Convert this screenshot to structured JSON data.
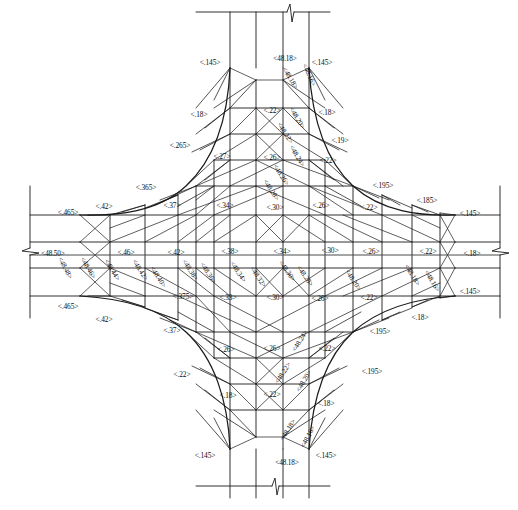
{
  "drawing": {
    "title": "Intersection Grading / Contour Plan",
    "units_note": "",
    "caption": "",
    "line_color": "#1a1a1a",
    "text_color": "#0d0d0d",
    "background": "#ffffff"
  },
  "elevations": {
    "center_west": "<48.50>",
    "list": [
      "<48.48>",
      "<48.46>",
      "<48.44>",
      "<48.42>",
      "<48.40>",
      "<48.38>",
      "<48.36>",
      "<48.34>",
      "<48.32>",
      "<48.30>",
      "<48.28>",
      "<48.26>",
      "<48.24>",
      "<48.22>",
      "<48.20>",
      "<48.18>",
      "<48.16>"
    ]
  },
  "edge_labels": {
    "north_center": "<48.18>",
    "south_center": "<48.18>",
    "west_center": "<48.50>",
    "east_center": "<.18>"
  },
  "slope_labels": {
    "values": [
      "<.145>",
      "<.18>",
      "<.19>",
      "<.195>",
      "<.185>",
      "<.22>",
      "<.26>",
      "<.265>",
      "<.27>",
      "<.30>",
      "<.33>",
      "<.34>",
      "<.365>",
      "<.37>",
      "<.375>",
      "<.38>",
      "<.42>",
      "<.46>",
      "<.465>"
    ]
  },
  "annotations": [
    {
      "id": "a01",
      "text": "<.145>",
      "x": 210,
      "y": 63,
      "rot": 0,
      "kind": "slope"
    },
    {
      "id": "a02",
      "text": "<48.18>",
      "x": 285,
      "y": 59,
      "rot": 0,
      "kind": "elev"
    },
    {
      "id": "a03",
      "text": "<.145>",
      "x": 322,
      "y": 63,
      "rot": 0,
      "kind": "slope"
    },
    {
      "id": "a04",
      "text": "<48.18>",
      "x": 290,
      "y": 78,
      "rot": 58,
      "kind": "elev"
    },
    {
      "id": "a05",
      "text": "<48.16>",
      "x": 309,
      "y": 75,
      "rot": 66,
      "kind": "elev"
    },
    {
      "id": "a06",
      "text": "<.18>",
      "x": 199,
      "y": 115,
      "rot": 0,
      "kind": "slope"
    },
    {
      "id": "a07",
      "text": "<.22>",
      "x": 272,
      "y": 111,
      "rot": 0,
      "kind": "slope"
    },
    {
      "id": "a08",
      "text": "<48.20>",
      "x": 297,
      "y": 118,
      "rot": 60,
      "kind": "elev"
    },
    {
      "id": "a09",
      "text": "<.18>",
      "x": 327,
      "y": 113,
      "rot": 0,
      "kind": "slope"
    },
    {
      "id": "a10",
      "text": "<48.22>",
      "x": 285,
      "y": 133,
      "rot": 57,
      "kind": "elev"
    },
    {
      "id": "a11",
      "text": "<.19>",
      "x": 340,
      "y": 141,
      "rot": 0,
      "kind": "slope"
    },
    {
      "id": "a12",
      "text": "<.265>",
      "x": 180,
      "y": 146,
      "rot": 0,
      "kind": "slope"
    },
    {
      "id": "a13",
      "text": "<.27>",
      "x": 222,
      "y": 157,
      "rot": 0,
      "kind": "slope"
    },
    {
      "id": "a14",
      "text": "<.26>",
      "x": 272,
      "y": 158,
      "rot": 0,
      "kind": "slope"
    },
    {
      "id": "a15",
      "text": "<48.24>",
      "x": 297,
      "y": 156,
      "rot": 60,
      "kind": "elev"
    },
    {
      "id": "a16",
      "text": "<.22>",
      "x": 328,
      "y": 161,
      "rot": 0,
      "kind": "slope"
    },
    {
      "id": "a17",
      "text": "<48.26>",
      "x": 281,
      "y": 175,
      "rot": 57,
      "kind": "elev"
    },
    {
      "id": "a18",
      "text": "<.365>",
      "x": 146,
      "y": 188,
      "rot": 0,
      "kind": "slope"
    },
    {
      "id": "a19",
      "text": "<48.28>",
      "x": 271,
      "y": 190,
      "rot": 57,
      "kind": "elev"
    },
    {
      "id": "a20",
      "text": "<.195>",
      "x": 383,
      "y": 186,
      "rot": 0,
      "kind": "slope"
    },
    {
      "id": "a21",
      "text": "<.185>",
      "x": 427,
      "y": 201,
      "rot": 0,
      "kind": "slope"
    },
    {
      "id": "a22",
      "text": "<.42>",
      "x": 104,
      "y": 207,
      "rot": 0,
      "kind": "slope"
    },
    {
      "id": "a23",
      "text": "<.37>",
      "x": 172,
      "y": 206,
      "rot": 0,
      "kind": "slope"
    },
    {
      "id": "a24",
      "text": "<.34>",
      "x": 225,
      "y": 206,
      "rot": 0,
      "kind": "slope"
    },
    {
      "id": "a25",
      "text": "<.30>",
      "x": 275,
      "y": 208,
      "rot": 0,
      "kind": "slope"
    },
    {
      "id": "a26",
      "text": "<.26>",
      "x": 321,
      "y": 206,
      "rot": 0,
      "kind": "slope"
    },
    {
      "id": "a27",
      "text": "<.22>",
      "x": 369,
      "y": 208,
      "rot": 0,
      "kind": "slope"
    },
    {
      "id": "a28",
      "text": "<.465>",
      "x": 68,
      "y": 213,
      "rot": 0,
      "kind": "slope"
    },
    {
      "id": "a29",
      "text": "<.145>",
      "x": 470,
      "y": 214,
      "rot": 0,
      "kind": "slope"
    },
    {
      "id": "a30",
      "text": "<48.50>",
      "x": 53,
      "y": 254,
      "rot": 0,
      "kind": "elev"
    },
    {
      "id": "a31",
      "text": "<48.48>",
      "x": 65,
      "y": 268,
      "rot": 62,
      "kind": "elev"
    },
    {
      "id": "a32",
      "text": "<48.46>",
      "x": 88,
      "y": 268,
      "rot": 60,
      "kind": "elev"
    },
    {
      "id": "a33",
      "text": "<.46>",
      "x": 126,
      "y": 253,
      "rot": 0,
      "kind": "slope"
    },
    {
      "id": "a34",
      "text": "<48.44>",
      "x": 112,
      "y": 270,
      "rot": 58,
      "kind": "elev"
    },
    {
      "id": "a35",
      "text": "<.42>",
      "x": 176,
      "y": 253,
      "rot": 0,
      "kind": "slope"
    },
    {
      "id": "a36",
      "text": "<48.42>",
      "x": 140,
      "y": 270,
      "rot": 57,
      "kind": "elev"
    },
    {
      "id": "a37",
      "text": "<48.40>",
      "x": 158,
      "y": 277,
      "rot": 57,
      "kind": "elev"
    },
    {
      "id": "a38",
      "text": "<.38>",
      "x": 230,
      "y": 252,
      "rot": 0,
      "kind": "slope"
    },
    {
      "id": "a39",
      "text": "<48.38>",
      "x": 190,
      "y": 270,
      "rot": 56,
      "kind": "elev"
    },
    {
      "id": "a40",
      "text": "<48.36>",
      "x": 208,
      "y": 273,
      "rot": 56,
      "kind": "elev"
    },
    {
      "id": "a41",
      "text": "<.34>",
      "x": 282,
      "y": 252,
      "rot": 0,
      "kind": "slope"
    },
    {
      "id": "a42",
      "text": "<48.34>",
      "x": 238,
      "y": 272,
      "rot": 56,
      "kind": "elev"
    },
    {
      "id": "a43",
      "text": "<48.32>",
      "x": 258,
      "y": 277,
      "rot": 56,
      "kind": "elev"
    },
    {
      "id": "a44",
      "text": "<.30>",
      "x": 330,
      "y": 251,
      "rot": 0,
      "kind": "slope"
    },
    {
      "id": "a45",
      "text": "<48.30>",
      "x": 287,
      "y": 271,
      "rot": 55,
      "kind": "elev"
    },
    {
      "id": "a46",
      "text": "<48.28>",
      "x": 305,
      "y": 276,
      "rot": 55,
      "kind": "elev"
    },
    {
      "id": "a47",
      "text": "<.26>",
      "x": 371,
      "y": 252,
      "rot": 0,
      "kind": "slope"
    },
    {
      "id": "a48",
      "text": "<48.20>",
      "x": 353,
      "y": 280,
      "rot": 57,
      "kind": "elev"
    },
    {
      "id": "a49",
      "text": "<.22>",
      "x": 428,
      "y": 252,
      "rot": 0,
      "kind": "slope"
    },
    {
      "id": "a50",
      "text": "<48.18>",
      "x": 412,
      "y": 275,
      "rot": 58,
      "kind": "elev"
    },
    {
      "id": "a51",
      "text": "<48.16>",
      "x": 432,
      "y": 281,
      "rot": 60,
      "kind": "elev"
    },
    {
      "id": "a52",
      "text": "<.18>",
      "x": 472,
      "y": 254,
      "rot": 0,
      "kind": "slope"
    },
    {
      "id": "a53",
      "text": "<.375>",
      "x": 183,
      "y": 297,
      "rot": 0,
      "kind": "slope"
    },
    {
      "id": "a54",
      "text": "<.33>",
      "x": 228,
      "y": 298,
      "rot": 0,
      "kind": "slope"
    },
    {
      "id": "a55",
      "text": "<.30>",
      "x": 275,
      "y": 298,
      "rot": 0,
      "kind": "slope"
    },
    {
      "id": "a56",
      "text": "<.26>",
      "x": 320,
      "y": 299,
      "rot": 0,
      "kind": "slope"
    },
    {
      "id": "a57",
      "text": "<.22>",
      "x": 369,
      "y": 298,
      "rot": 0,
      "kind": "slope"
    },
    {
      "id": "a58",
      "text": "<.145>",
      "x": 470,
      "y": 292,
      "rot": 0,
      "kind": "slope"
    },
    {
      "id": "a59",
      "text": "<.465>",
      "x": 68,
      "y": 307,
      "rot": 0,
      "kind": "slope"
    },
    {
      "id": "a60",
      "text": "<.42>",
      "x": 104,
      "y": 320,
      "rot": 0,
      "kind": "slope"
    },
    {
      "id": "a61",
      "text": "<.26>",
      "x": 226,
      "y": 350,
      "rot": 0,
      "kind": "slope"
    },
    {
      "id": "a62",
      "text": "<.26>",
      "x": 272,
      "y": 349,
      "rot": 0,
      "kind": "slope"
    },
    {
      "id": "a63",
      "text": "<48.24>",
      "x": 300,
      "y": 341,
      "rot": -58,
      "kind": "elev"
    },
    {
      "id": "a64",
      "text": "<.22>",
      "x": 327,
      "y": 349,
      "rot": 0,
      "kind": "slope"
    },
    {
      "id": "a65",
      "text": "<.37>",
      "x": 172,
      "y": 331,
      "rot": 0,
      "kind": "slope"
    },
    {
      "id": "a66",
      "text": "<.195>",
      "x": 380,
      "y": 332,
      "rot": 0,
      "kind": "slope"
    },
    {
      "id": "a67",
      "text": "<.18>",
      "x": 420,
      "y": 318,
      "rot": 0,
      "kind": "slope"
    },
    {
      "id": "a68",
      "text": "<48.22>",
      "x": 283,
      "y": 373,
      "rot": -57,
      "kind": "elev"
    },
    {
      "id": "a69",
      "text": "<.22>",
      "x": 182,
      "y": 375,
      "rot": 0,
      "kind": "slope"
    },
    {
      "id": "a70",
      "text": "<48.20>",
      "x": 304,
      "y": 381,
      "rot": -60,
      "kind": "elev"
    },
    {
      "id": "a71",
      "text": "<.195>",
      "x": 372,
      "y": 372,
      "rot": 0,
      "kind": "slope"
    },
    {
      "id": "a72",
      "text": "<.18>",
      "x": 228,
      "y": 396,
      "rot": 0,
      "kind": "slope"
    },
    {
      "id": "a73",
      "text": "<.22>",
      "x": 272,
      "y": 395,
      "rot": 0,
      "kind": "slope"
    },
    {
      "id": "a74",
      "text": "<.18>",
      "x": 326,
      "y": 404,
      "rot": 0,
      "kind": "slope"
    },
    {
      "id": "a75",
      "text": "<48.18>",
      "x": 288,
      "y": 430,
      "rot": -58,
      "kind": "elev"
    },
    {
      "id": "a76",
      "text": "<48.16>",
      "x": 308,
      "y": 437,
      "rot": -62,
      "kind": "elev"
    },
    {
      "id": "a77",
      "text": "<.145>",
      "x": 205,
      "y": 456,
      "rot": 0,
      "kind": "slope"
    },
    {
      "id": "a78",
      "text": "<48.18>",
      "x": 287,
      "y": 463,
      "rot": 0,
      "kind": "elev"
    },
    {
      "id": "a79",
      "text": "<.145>",
      "x": 326,
      "y": 456,
      "rot": 0,
      "kind": "slope"
    }
  ]
}
